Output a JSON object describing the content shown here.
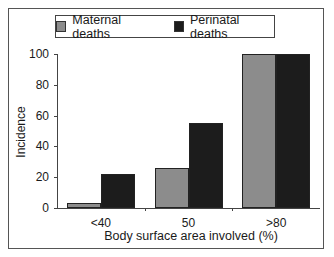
{
  "chart_data": {
    "type": "bar",
    "title": "",
    "xlabel": "Body surface area involved (%)",
    "ylabel": "Incidence",
    "categories": [
      "<40",
      "50",
      ">80"
    ],
    "series": [
      {
        "name": "Maternal deaths",
        "color": "#8c8c8c",
        "values": [
          3,
          26,
          100
        ]
      },
      {
        "name": "Perinatal deaths",
        "color": "#1c1c1c",
        "values": [
          22,
          55,
          100
        ]
      }
    ],
    "ylim": [
      0,
      100
    ],
    "yticks": [
      0,
      20,
      40,
      60,
      80,
      100
    ],
    "grid": false,
    "legend_position": "top"
  },
  "legend": {
    "items": [
      {
        "label": "Maternal deaths",
        "color": "#8c8c8c"
      },
      {
        "label": "Perinatal deaths",
        "color": "#1c1c1c"
      }
    ]
  }
}
